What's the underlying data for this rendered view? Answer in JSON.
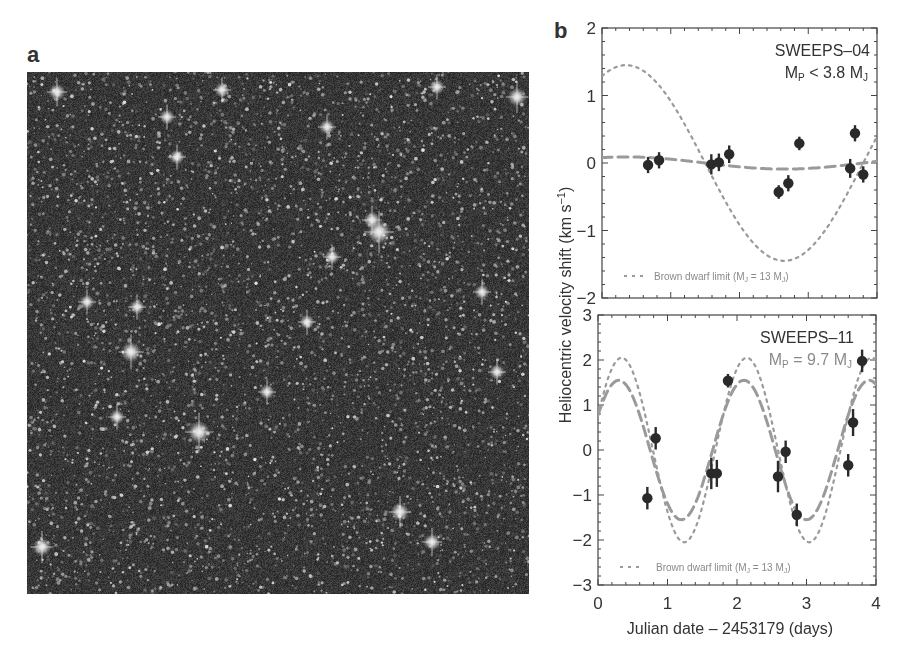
{
  "panels": {
    "a": {
      "label": "a",
      "description": "Starfield image (Hubble SWEEPS field, Galactic bulge)"
    },
    "b": {
      "label": "b"
    }
  },
  "chart_data": [
    {
      "type": "scatter",
      "panel": "b-top",
      "title": "SWEEPS-04",
      "annotation": "Mp < 3.8 MJ",
      "xlabel": "Julian date - 2453179 (days)",
      "ylabel": "Heliocentric velocity shift (km s^-1)",
      "xlim": [
        0,
        4
      ],
      "ylim": [
        -2,
        2
      ],
      "xticks": [
        0,
        1,
        2,
        3,
        4
      ],
      "yticks": [
        -2,
        -1,
        0,
        1,
        2
      ],
      "legend": {
        "text": "Brown dwarf limit  (MJ = 13 MJ)",
        "position": "lower center",
        "style": "dotted"
      },
      "series": [
        {
          "name": "Observed RV",
          "style": "points-with-errorbars",
          "x": [
            0.67,
            0.83,
            1.59,
            1.7,
            1.85,
            2.57,
            2.71,
            2.87,
            3.61,
            3.68,
            3.8
          ],
          "y": [
            -0.03,
            0.04,
            -0.02,
            0.01,
            0.13,
            -0.43,
            -0.3,
            0.29,
            -0.08,
            0.44,
            -0.17
          ],
          "yerr": [
            0.12,
            0.12,
            0.15,
            0.13,
            0.13,
            0.1,
            0.12,
            0.1,
            0.14,
            0.12,
            0.12
          ]
        },
        {
          "name": "Best fit",
          "style": "dashed",
          "amplitude": 0.09,
          "period": 4.6,
          "peak_x": 0.35
        },
        {
          "name": "Brown dwarf limit",
          "style": "dotted",
          "amplitude": 1.45,
          "period": 4.6,
          "peak_x": 0.35
        }
      ]
    },
    {
      "type": "scatter",
      "panel": "b-bottom",
      "title": "SWEEPS-11",
      "annotation": "Mp = 9.7 MJ",
      "xlabel": "Julian date - 2453179 (days)",
      "ylabel": "Heliocentric velocity shift (km s^-1)",
      "xlim": [
        0,
        4
      ],
      "ylim": [
        -3,
        3
      ],
      "xticks": [
        0,
        1,
        2,
        3,
        4
      ],
      "yticks": [
        -3,
        -2,
        -1,
        0,
        1,
        2,
        3
      ],
      "legend": {
        "text": "Brown dwarf limit  (MJ = 13 MJ)",
        "position": "lower center",
        "style": "dotted"
      },
      "series": [
        {
          "name": "Observed RV",
          "style": "points-with-errorbars",
          "x": [
            0.71,
            0.83,
            1.63,
            1.71,
            1.87,
            2.59,
            2.7,
            2.86,
            3.6,
            3.67,
            3.8
          ],
          "y": [
            -1.07,
            0.26,
            -0.52,
            -0.52,
            1.54,
            -0.59,
            -0.04,
            -1.44,
            -0.34,
            0.61,
            1.98
          ],
          "yerr": [
            0.25,
            0.25,
            0.35,
            0.3,
            0.15,
            0.35,
            0.25,
            0.25,
            0.25,
            0.3,
            0.25
          ]
        },
        {
          "name": "Best fit",
          "style": "dashed",
          "amplitude": 1.55,
          "period": 1.8,
          "peak_x": 0.3
        },
        {
          "name": "Brown dwarf limit",
          "style": "dotted",
          "amplitude": 2.05,
          "period": 1.8,
          "peak_x": 0.34
        }
      ]
    }
  ],
  "text": {
    "top_title": "SWEEPS–04",
    "top_mass_main": "M",
    "top_mass_sub": "P",
    "top_mass_rest": " < 3.8 M",
    "top_mass_sub2": "J",
    "bottom_title": "SWEEPS–11",
    "bottom_mass_main": "M",
    "bottom_mass_sub": "P",
    "bottom_mass_rest": " = 9.7 M",
    "bottom_mass_sub2": "J",
    "legend_text": "Brown dwarf limit  (M",
    "legend_sub": "J",
    "legend_rest": " = 13 M",
    "legend_sub2": "J",
    "legend_close": ")",
    "xlabel": "Julian date – 2453179 (days)",
    "ylabel": "Heliocentric velocity shift (km s",
    "ylabel_sup": "−1",
    "ylabel_close": ")"
  }
}
